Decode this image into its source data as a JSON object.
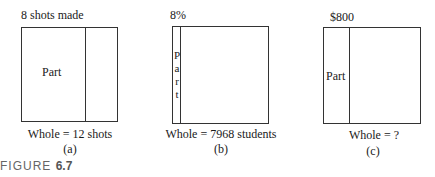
{
  "figure": {
    "caption_prefix": "FIGURE",
    "caption_number": "6.7"
  },
  "panels": [
    {
      "id": "a",
      "top_label": "8 shots made",
      "part_label": "Part",
      "whole_label": "Whole = 12 shots",
      "sub_label": "(a)"
    },
    {
      "id": "b",
      "top_label": "8%",
      "part_label_letters": [
        "P",
        "a",
        "r",
        "t"
      ],
      "whole_label": "Whole = 7968 students",
      "sub_label": "(b)"
    },
    {
      "id": "c",
      "top_label": "$800",
      "part_label": "Part",
      "whole_label": "Whole = ?",
      "sub_label": "(c)"
    }
  ]
}
